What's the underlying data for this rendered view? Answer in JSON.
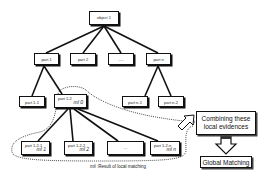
{
  "diagram": {
    "root": {
      "label": "object 1"
    },
    "level1": [
      {
        "label": "part 1"
      },
      {
        "label": "part 2"
      },
      {
        "label": "....."
      },
      {
        "label": "part n"
      }
    ],
    "level2": [
      {
        "label": "part 1-1"
      },
      {
        "label": "part 1-2",
        "ml": "ml 0"
      },
      {
        "label": "part n-1"
      },
      {
        "label": "part n-2"
      }
    ],
    "level3": [
      {
        "label": "part 1-2-1",
        "ml": "ml 1"
      },
      {
        "label": "part 1-2-2",
        "ml": "ml 2"
      },
      {
        "label": "..."
      },
      {
        "label": "part 1-2-n",
        "ml": "ml n"
      }
    ],
    "combine_box": {
      "line1": "Combining these",
      "line2": "local evidences"
    },
    "global_box": {
      "label": "Global Matching"
    },
    "caption": {
      "symbol": "mli",
      "text": " :Result of local matching"
    }
  }
}
